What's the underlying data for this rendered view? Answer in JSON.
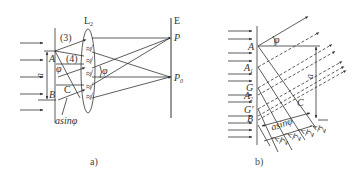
{
  "figure_a": {
    "caption": "a)",
    "lens_label": "L",
    "lens_sub": "2",
    "screen_label": "E",
    "point_p": "P",
    "point_p0": "P",
    "point_p0_sub": "0",
    "label_3": "(3)",
    "label_4": "(4)",
    "point_a": "A",
    "point_b": "B",
    "point_c": "C",
    "width_label": "a",
    "angle_label": "φ",
    "angle_label_lens": "φ",
    "path_diff_label": "asinφ"
  },
  "figure_b": {
    "caption": "b)",
    "point_a": "A",
    "point_a1": "A",
    "point_a1_sub": "1",
    "point_g": "G",
    "point_a2": "A",
    "point_a2_sub": "2",
    "point_g_prime": "G′",
    "point_b": "B",
    "point_c": "C",
    "angle_label": "φ",
    "width_label": "a",
    "path_diff_label": "asinφ",
    "half_wave_num": "λ",
    "half_wave_den": "2"
  },
  "colors": {
    "line": "#333333",
    "text": "#333333"
  }
}
